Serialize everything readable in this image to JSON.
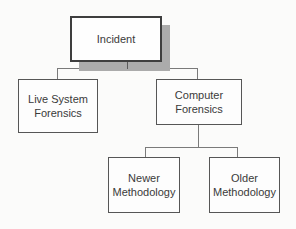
{
  "diagram": {
    "type": "hierarchy-flowchart",
    "nodes": {
      "incident": {
        "label": "Incident"
      },
      "live_system_forensics": {
        "lines": [
          "Live System",
          "Forensics"
        ]
      },
      "computer_forensics": {
        "lines": [
          "Computer",
          "Forensics"
        ]
      },
      "newer_methodology": {
        "lines": [
          "Newer",
          "Methodology"
        ]
      },
      "older_methodology": {
        "lines": [
          "Older",
          "Methodology"
        ]
      }
    },
    "edges": [
      {
        "from": "Incident",
        "to": "Live System Forensics"
      },
      {
        "from": "Incident",
        "to": "Computer Forensics"
      },
      {
        "from": "Computer Forensics",
        "to": "Newer Methodology"
      },
      {
        "from": "Computer Forensics",
        "to": "Older Methodology"
      }
    ],
    "colors": {
      "background": "#fbfbfa",
      "box_fill": "#fdfdfd",
      "box_border": "#565656",
      "root_border": "#3e3e3e",
      "root_shadow": "#ababab",
      "connector": "#7a7a7a",
      "text": "#3a3a3a"
    }
  }
}
